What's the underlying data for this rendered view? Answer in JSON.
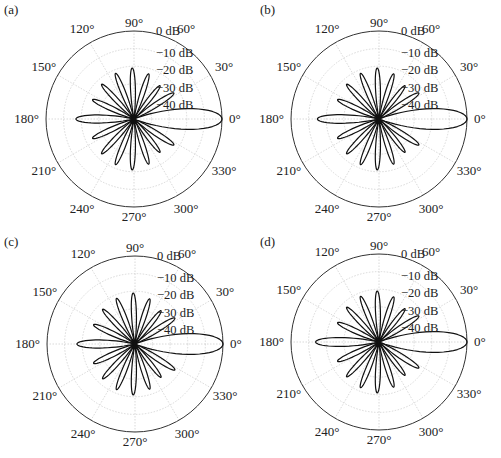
{
  "chart_data": [
    {
      "type": "polar",
      "panel": "(a)",
      "title": "",
      "center_px": [
        134,
        119
      ],
      "radius_px": 88,
      "r_scale_db": [
        -50,
        0
      ],
      "r_tick_labels": [
        "0 dB",
        "−10 dB",
        "−20 dB",
        "−30 dB",
        "−40 dB"
      ],
      "r_ticks_db": [
        0,
        -10,
        -20,
        -30,
        -40
      ],
      "theta_tick_labels": [
        "0°",
        "30°",
        "60°",
        "90°",
        "120°",
        "150°",
        "180°",
        "210°",
        "240°",
        "270°",
        "300°",
        "330°"
      ],
      "grid": true,
      "main_lobe_connected_to_origin": false,
      "lobes": [
        {
          "angle_deg": 0,
          "peak_db": 0,
          "half_width_deg": 22
        },
        {
          "angle_deg": 33,
          "peak_db": -23,
          "half_width_deg": 10
        },
        {
          "angle_deg": 52,
          "peak_db": -26,
          "half_width_deg": 9
        },
        {
          "angle_deg": 72,
          "peak_db": -23,
          "half_width_deg": 9
        },
        {
          "angle_deg": 92,
          "peak_db": -21,
          "half_width_deg": 9
        },
        {
          "angle_deg": 112,
          "peak_db": -22,
          "half_width_deg": 9
        },
        {
          "angle_deg": 133,
          "peak_db": -23,
          "half_width_deg": 9
        },
        {
          "angle_deg": 155,
          "peak_db": -24,
          "half_width_deg": 10
        },
        {
          "angle_deg": 180,
          "peak_db": -17,
          "half_width_deg": 13
        },
        {
          "angle_deg": 205,
          "peak_db": -24,
          "half_width_deg": 10
        },
        {
          "angle_deg": 227,
          "peak_db": -23,
          "half_width_deg": 9
        },
        {
          "angle_deg": 248,
          "peak_db": -22,
          "half_width_deg": 9
        },
        {
          "angle_deg": 268,
          "peak_db": -21,
          "half_width_deg": 9
        },
        {
          "angle_deg": 288,
          "peak_db": -23,
          "half_width_deg": 9
        },
        {
          "angle_deg": 308,
          "peak_db": -26,
          "half_width_deg": 9
        },
        {
          "angle_deg": 327,
          "peak_db": -23,
          "half_width_deg": 10
        }
      ]
    },
    {
      "type": "polar",
      "panel": "(b)",
      "title": "",
      "center_px": [
        379,
        119
      ],
      "radius_px": 88,
      "r_scale_db": [
        -50,
        0
      ],
      "r_tick_labels": [
        "0 dB",
        "−10 dB",
        "−20 dB",
        "−30 dB",
        "−40 dB"
      ],
      "r_ticks_db": [
        0,
        -10,
        -20,
        -30,
        -40
      ],
      "theta_tick_labels": [
        "0°",
        "30°",
        "60°",
        "90°",
        "120°",
        "150°",
        "180°",
        "210°",
        "240°",
        "270°",
        "300°",
        "330°"
      ],
      "grid": true,
      "main_lobe_connected_to_origin": true,
      "lobes": [
        {
          "angle_deg": 0,
          "peak_db": 0,
          "half_width_deg": 22
        },
        {
          "angle_deg": 33,
          "peak_db": -23,
          "half_width_deg": 10
        },
        {
          "angle_deg": 52,
          "peak_db": -26,
          "half_width_deg": 9
        },
        {
          "angle_deg": 72,
          "peak_db": -23,
          "half_width_deg": 9
        },
        {
          "angle_deg": 92,
          "peak_db": -21,
          "half_width_deg": 9
        },
        {
          "angle_deg": 112,
          "peak_db": -22,
          "half_width_deg": 9
        },
        {
          "angle_deg": 133,
          "peak_db": -23,
          "half_width_deg": 9
        },
        {
          "angle_deg": 155,
          "peak_db": -24,
          "half_width_deg": 10
        },
        {
          "angle_deg": 180,
          "peak_db": -15,
          "half_width_deg": 13
        },
        {
          "angle_deg": 205,
          "peak_db": -24,
          "half_width_deg": 10
        },
        {
          "angle_deg": 227,
          "peak_db": -23,
          "half_width_deg": 9
        },
        {
          "angle_deg": 248,
          "peak_db": -22,
          "half_width_deg": 9
        },
        {
          "angle_deg": 268,
          "peak_db": -21,
          "half_width_deg": 9
        },
        {
          "angle_deg": 288,
          "peak_db": -23,
          "half_width_deg": 9
        },
        {
          "angle_deg": 308,
          "peak_db": -26,
          "half_width_deg": 9
        },
        {
          "angle_deg": 327,
          "peak_db": -23,
          "half_width_deg": 10
        }
      ]
    },
    {
      "type": "polar",
      "panel": "(c)",
      "title": "",
      "center_px": [
        135,
        344
      ],
      "radius_px": 88,
      "r_scale_db": [
        -50,
        0
      ],
      "r_tick_labels": [
        "0 dB",
        "−10 dB",
        "−20 dB",
        "−30 dB",
        "−40 dB"
      ],
      "r_ticks_db": [
        0,
        -10,
        -20,
        -30,
        -40
      ],
      "theta_tick_labels": [
        "0°",
        "30°",
        "60°",
        "90°",
        "120°",
        "150°",
        "180°",
        "210°",
        "240°",
        "270°",
        "300°",
        "330°"
      ],
      "grid": true,
      "main_lobe_connected_to_origin": false,
      "lobes": [
        {
          "angle_deg": 0,
          "peak_db": 0,
          "half_width_deg": 22
        },
        {
          "angle_deg": 33,
          "peak_db": -23,
          "half_width_deg": 10
        },
        {
          "angle_deg": 52,
          "peak_db": -26,
          "half_width_deg": 9
        },
        {
          "angle_deg": 72,
          "peak_db": -23,
          "half_width_deg": 9
        },
        {
          "angle_deg": 92,
          "peak_db": -21,
          "half_width_deg": 9
        },
        {
          "angle_deg": 112,
          "peak_db": -22,
          "half_width_deg": 9
        },
        {
          "angle_deg": 133,
          "peak_db": -23,
          "half_width_deg": 9
        },
        {
          "angle_deg": 155,
          "peak_db": -24,
          "half_width_deg": 10
        },
        {
          "angle_deg": 180,
          "peak_db": -17,
          "half_width_deg": 13
        },
        {
          "angle_deg": 205,
          "peak_db": -24,
          "half_width_deg": 10
        },
        {
          "angle_deg": 227,
          "peak_db": -23,
          "half_width_deg": 9
        },
        {
          "angle_deg": 248,
          "peak_db": -22,
          "half_width_deg": 9
        },
        {
          "angle_deg": 268,
          "peak_db": -21,
          "half_width_deg": 9
        },
        {
          "angle_deg": 288,
          "peak_db": -23,
          "half_width_deg": 9
        },
        {
          "angle_deg": 308,
          "peak_db": -26,
          "half_width_deg": 9
        },
        {
          "angle_deg": 327,
          "peak_db": -23,
          "half_width_deg": 10
        }
      ]
    },
    {
      "type": "polar",
      "panel": "(d)",
      "title": "",
      "center_px": [
        379,
        342
      ],
      "radius_px": 88,
      "r_scale_db": [
        -50,
        0
      ],
      "r_tick_labels": [
        "0 dB",
        "−10 dB",
        "−20 dB",
        "−30 dB",
        "−40 dB"
      ],
      "r_ticks_db": [
        0,
        -10,
        -20,
        -30,
        -40
      ],
      "theta_tick_labels": [
        "0°",
        "30°",
        "60°",
        "90°",
        "120°",
        "150°",
        "180°",
        "210°",
        "240°",
        "270°",
        "300°",
        "330°"
      ],
      "grid": true,
      "main_lobe_connected_to_origin": true,
      "lobes": [
        {
          "angle_deg": 0,
          "peak_db": 0,
          "half_width_deg": 22
        },
        {
          "angle_deg": 33,
          "peak_db": -23,
          "half_width_deg": 10
        },
        {
          "angle_deg": 52,
          "peak_db": -26,
          "half_width_deg": 9
        },
        {
          "angle_deg": 72,
          "peak_db": -23,
          "half_width_deg": 9
        },
        {
          "angle_deg": 92,
          "peak_db": -21,
          "half_width_deg": 9
        },
        {
          "angle_deg": 112,
          "peak_db": -22,
          "half_width_deg": 9
        },
        {
          "angle_deg": 133,
          "peak_db": -23,
          "half_width_deg": 9
        },
        {
          "angle_deg": 155,
          "peak_db": -24,
          "half_width_deg": 10
        },
        {
          "angle_deg": 180,
          "peak_db": -14,
          "half_width_deg": 13
        },
        {
          "angle_deg": 205,
          "peak_db": -24,
          "half_width_deg": 10
        },
        {
          "angle_deg": 227,
          "peak_db": -23,
          "half_width_deg": 9
        },
        {
          "angle_deg": 248,
          "peak_db": -22,
          "half_width_deg": 9
        },
        {
          "angle_deg": 268,
          "peak_db": -21,
          "half_width_deg": 9
        },
        {
          "angle_deg": 288,
          "peak_db": -23,
          "half_width_deg": 9
        },
        {
          "angle_deg": 308,
          "peak_db": -26,
          "half_width_deg": 9
        },
        {
          "angle_deg": 327,
          "peak_db": -23,
          "half_width_deg": 10
        }
      ]
    }
  ]
}
